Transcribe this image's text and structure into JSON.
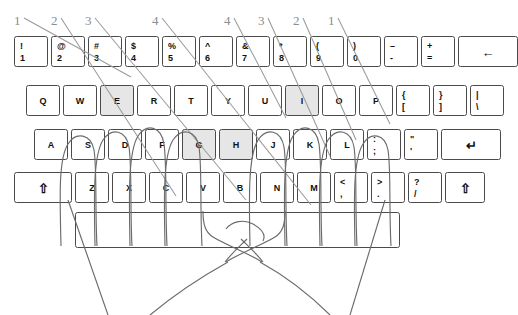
{
  "diagram": {
    "home_key_fill": "#e6e6e6",
    "line_color": "#6b6b6b",
    "callout_color": "#8c8c8c"
  },
  "finger_callouts": [
    {
      "label": "1",
      "x": 14,
      "y": 14,
      "side": "left"
    },
    {
      "label": "2",
      "x": 51,
      "y": 14,
      "side": "left"
    },
    {
      "label": "3",
      "x": 85,
      "y": 14,
      "side": "left"
    },
    {
      "label": "4",
      "x": 152,
      "y": 14,
      "side": "left"
    },
    {
      "label": "4",
      "x": 224,
      "y": 14,
      "side": "right"
    },
    {
      "label": "3",
      "x": 258,
      "y": 14,
      "side": "right"
    },
    {
      "label": "2",
      "x": 293,
      "y": 14,
      "side": "right"
    },
    {
      "label": "1",
      "x": 328,
      "y": 14,
      "side": "right"
    }
  ],
  "keyboard": {
    "rows": [
      {
        "name": "number-row",
        "y": 36,
        "x": 14,
        "h": 31,
        "keys": [
          {
            "name": "key-1",
            "top": "!",
            "bottom": "1",
            "w": 34,
            "type": "dual"
          },
          {
            "name": "key-2",
            "top": "@",
            "bottom": "2",
            "w": 34,
            "type": "dual"
          },
          {
            "name": "key-3",
            "top": "#",
            "bottom": "3",
            "w": 34,
            "type": "dual"
          },
          {
            "name": "key-4",
            "top": "$",
            "bottom": "4",
            "w": 34,
            "type": "dual"
          },
          {
            "name": "key-5",
            "top": "%",
            "bottom": "5",
            "w": 34,
            "type": "dual"
          },
          {
            "name": "key-6",
            "top": "^",
            "bottom": "6",
            "w": 34,
            "type": "dual"
          },
          {
            "name": "key-7",
            "top": "&",
            "bottom": "7",
            "w": 34,
            "type": "dual"
          },
          {
            "name": "key-8",
            "top": "*",
            "bottom": "8",
            "w": 34,
            "type": "dual"
          },
          {
            "name": "key-9",
            "top": "(",
            "bottom": "9",
            "w": 34,
            "type": "dual"
          },
          {
            "name": "key-0",
            "top": ")",
            "bottom": "0",
            "w": 34,
            "type": "dual"
          },
          {
            "name": "key-minus",
            "top": "–",
            "bottom": "-",
            "w": 34,
            "type": "dual"
          },
          {
            "name": "key-equals",
            "top": "+",
            "bottom": "=",
            "w": 34,
            "type": "dual"
          },
          {
            "name": "key-backspace",
            "label": "←",
            "w": 60,
            "type": "wide"
          }
        ]
      },
      {
        "name": "qwerty-row",
        "y": 85,
        "x": 26,
        "h": 31,
        "keys": [
          {
            "name": "key-q",
            "label": "Q",
            "w": 34,
            "type": "single"
          },
          {
            "name": "key-w",
            "label": "W",
            "w": 34,
            "type": "single"
          },
          {
            "name": "key-e",
            "label": "E",
            "w": 34,
            "type": "single",
            "shaded": true
          },
          {
            "name": "key-r",
            "label": "R",
            "w": 34,
            "type": "single"
          },
          {
            "name": "key-t",
            "label": "T",
            "w": 34,
            "type": "single"
          },
          {
            "name": "key-y",
            "label": "Y",
            "w": 34,
            "type": "single"
          },
          {
            "name": "key-u",
            "label": "U",
            "w": 34,
            "type": "single"
          },
          {
            "name": "key-i",
            "label": "I",
            "w": 34,
            "type": "single",
            "shaded": true
          },
          {
            "name": "key-o",
            "label": "O",
            "w": 34,
            "type": "single"
          },
          {
            "name": "key-p",
            "label": "P",
            "w": 34,
            "type": "single"
          },
          {
            "name": "key-bracket-left",
            "top": "{",
            "bottom": "[",
            "w": 34,
            "type": "dual"
          },
          {
            "name": "key-bracket-right",
            "top": "}",
            "bottom": "]",
            "w": 34,
            "type": "dual"
          },
          {
            "name": "key-backslash",
            "top": "|",
            "bottom": "\\",
            "w": 34,
            "type": "dual"
          }
        ]
      },
      {
        "name": "home-row",
        "y": 129,
        "x": 34,
        "h": 31,
        "keys": [
          {
            "name": "key-a",
            "label": "A",
            "w": 34,
            "type": "single"
          },
          {
            "name": "key-s",
            "label": "S",
            "w": 34,
            "type": "single"
          },
          {
            "name": "key-d",
            "label": "D",
            "w": 34,
            "type": "single"
          },
          {
            "name": "key-f",
            "label": "F",
            "w": 34,
            "type": "single"
          },
          {
            "name": "key-g",
            "label": "G",
            "w": 34,
            "type": "single",
            "shaded": true
          },
          {
            "name": "key-h",
            "label": "H",
            "w": 34,
            "type": "single",
            "shaded": true
          },
          {
            "name": "key-j",
            "label": "J",
            "w": 34,
            "type": "single"
          },
          {
            "name": "key-k",
            "label": "K",
            "w": 34,
            "type": "single"
          },
          {
            "name": "key-l",
            "label": "L",
            "w": 34,
            "type": "single"
          },
          {
            "name": "key-semicolon",
            "top": ":",
            "bottom": ";",
            "w": 34,
            "type": "dual"
          },
          {
            "name": "key-quote",
            "top": "\"",
            "bottom": "'",
            "w": 34,
            "type": "dual"
          },
          {
            "name": "key-enter",
            "label": "↵",
            "w": 60,
            "type": "wide"
          }
        ]
      },
      {
        "name": "bottom-row",
        "y": 172,
        "x": 14,
        "h": 31,
        "keys": [
          {
            "name": "key-shift-left",
            "label": "⇧",
            "w": 58,
            "type": "wide"
          },
          {
            "name": "key-z",
            "label": "Z",
            "w": 34,
            "type": "single"
          },
          {
            "name": "key-x",
            "label": "X",
            "w": 34,
            "type": "single"
          },
          {
            "name": "key-c",
            "label": "C",
            "w": 34,
            "type": "single"
          },
          {
            "name": "key-v",
            "label": "V",
            "w": 34,
            "type": "single"
          },
          {
            "name": "key-b",
            "label": "B",
            "w": 34,
            "type": "single"
          },
          {
            "name": "key-n",
            "label": "N",
            "w": 34,
            "type": "single"
          },
          {
            "name": "key-m",
            "label": "M",
            "w": 34,
            "type": "single"
          },
          {
            "name": "key-comma",
            "top": "<",
            "bottom": ",",
            "w": 34,
            "type": "dual"
          },
          {
            "name": "key-period",
            "top": ">",
            "bottom": ".",
            "w": 34,
            "type": "dual"
          },
          {
            "name": "key-slash",
            "top": "?",
            "bottom": "/",
            "w": 34,
            "type": "dual"
          },
          {
            "name": "key-shift-right",
            "label": "⇧",
            "w": 40,
            "type": "wide"
          }
        ]
      },
      {
        "name": "space-row",
        "y": 212,
        "x": 75,
        "h": 36,
        "keys": [
          {
            "name": "key-space",
            "label": "",
            "w": 325,
            "type": "wide"
          }
        ]
      }
    ]
  }
}
